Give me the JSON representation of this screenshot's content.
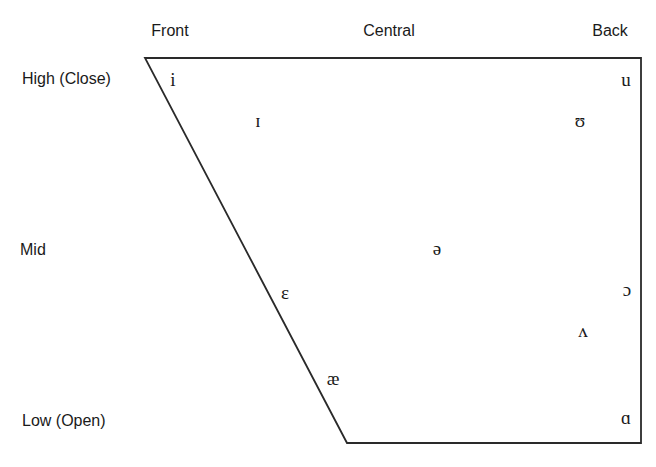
{
  "diagram": {
    "title": "",
    "type": "vowel-quadrilateral",
    "columns": [
      {
        "label": "Front",
        "x": 170,
        "y": 31
      },
      {
        "label": "Central",
        "x": 389,
        "y": 31
      },
      {
        "label": "Back",
        "x": 610,
        "y": 31
      }
    ],
    "rows": [
      {
        "label": "High (Close)",
        "x": 22,
        "y": 79
      },
      {
        "label": "Mid",
        "x": 20,
        "y": 250
      },
      {
        "label": "Low (Open)",
        "x": 22,
        "y": 421
      }
    ],
    "shape": {
      "points": [
        [
          145,
          58
        ],
        [
          641,
          58
        ],
        [
          641,
          443
        ],
        [
          347,
          443
        ]
      ],
      "stroke": "#2a2a2a"
    },
    "vowels": [
      {
        "symbol": "i",
        "name": "close-front-unrounded",
        "x": 173,
        "y": 79
      },
      {
        "symbol": "ɪ",
        "name": "near-close-front-unrounded",
        "x": 258,
        "y": 120
      },
      {
        "symbol": "u",
        "name": "close-back-rounded",
        "x": 626,
        "y": 79
      },
      {
        "symbol": "ʊ",
        "name": "near-close-back-rounded",
        "x": 580,
        "y": 120
      },
      {
        "symbol": "ə",
        "name": "schwa",
        "x": 437,
        "y": 248
      },
      {
        "symbol": "ɛ",
        "name": "open-mid-front-unrounded",
        "x": 285,
        "y": 292
      },
      {
        "symbol": "ɔ",
        "name": "open-mid-back-rounded",
        "x": 627,
        "y": 289
      },
      {
        "symbol": "ʌ",
        "name": "open-mid-back-unrounded",
        "x": 583,
        "y": 330
      },
      {
        "symbol": "æ",
        "name": "near-open-front-unrounded",
        "x": 333,
        "y": 378
      },
      {
        "symbol": "ɑ",
        "name": "open-back-unrounded",
        "x": 626,
        "y": 417
      }
    ]
  }
}
